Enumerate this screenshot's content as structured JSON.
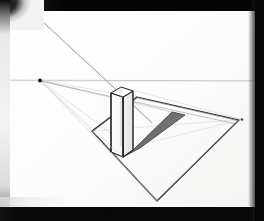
{
  "image": {
    "kind": "scanned-pencil-drawing",
    "subject": "two-point perspective construction of a tall building with cast shadow",
    "width": 264,
    "height": 221
  },
  "colors": {
    "paper": "#fdfdfd",
    "paper_tint": "#f4f4f2",
    "ink_dark": "#1d1d1d",
    "ink_medium": "#555555",
    "ink_light": "#b8b8b8",
    "construction_line": "#cfcfcf",
    "shadow_fill": "#6d6d6d",
    "shadow_fill_light": "#8b8b8b",
    "building_face_light": "#fbfbfb",
    "building_face_dark": "#efefef",
    "border_dark": "#070707",
    "vignette_glow": "#e9e9e9"
  },
  "geometry": {
    "horizon": {
      "y": 80,
      "x_start": 6,
      "x_end": 255
    },
    "vanishing_point_left": {
      "x": 40,
      "y": 80.5
    },
    "vanishing_point_right": {
      "x": 242,
      "y": 119.5
    },
    "light_source_ray": {
      "x1": 33,
      "y1": 14,
      "x2": 150,
      "y2": 122
    },
    "ground_plane": [
      {
        "x": 92,
        "y": 131
      },
      {
        "x": 137,
        "y": 97
      },
      {
        "x": 239,
        "y": 120
      },
      {
        "x": 157,
        "y": 201
      }
    ],
    "building_top_face": [
      {
        "x": 111,
        "y": 93
      },
      {
        "x": 121,
        "y": 87
      },
      {
        "x": 133,
        "y": 91
      },
      {
        "x": 123,
        "y": 97
      }
    ],
    "building_height_px": 62,
    "building_base": [
      {
        "x": 111,
        "y": 152
      },
      {
        "x": 123,
        "y": 157
      },
      {
        "x": 133,
        "y": 150
      }
    ],
    "shadow_polygon": [
      {
        "x": 123,
        "y": 157
      },
      {
        "x": 133,
        "y": 150
      },
      {
        "x": 172,
        "y": 112
      },
      {
        "x": 185,
        "y": 115
      },
      {
        "x": 140,
        "y": 148
      }
    ]
  },
  "labels": {
    "horizon_line": "horizon line",
    "vp_left": "left vanishing point",
    "vp_right": "right vanishing point",
    "light_ray": "light ray",
    "ground_plane": "ground plane",
    "building": "building prism",
    "cast_shadow": "cast shadow"
  }
}
